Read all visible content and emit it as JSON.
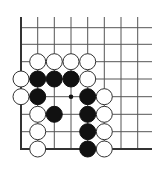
{
  "diagram": {
    "type": "go-board-fragment",
    "background": "#ffffff",
    "line_color": "#555555",
    "grid": {
      "columns": 8,
      "rows": 8,
      "col_x": [
        21,
        37.7,
        54.3,
        71,
        87.7,
        104.3,
        121,
        137.7
      ],
      "row_y": [
        27.7,
        44.3,
        61.7,
        79,
        96.7,
        114.3,
        131.7,
        149
      ],
      "top_open_y": 17,
      "right_open_x": 152,
      "left_edge": true,
      "bottom_edge": true
    },
    "stone_radius": 8,
    "stones": [
      {
        "color": "white",
        "col": 1,
        "row": 2
      },
      {
        "color": "white",
        "col": 2,
        "row": 2
      },
      {
        "color": "white",
        "col": 3,
        "row": 2
      },
      {
        "color": "white",
        "col": 4,
        "row": 2
      },
      {
        "color": "white",
        "col": 0,
        "row": 3
      },
      {
        "color": "black",
        "col": 1,
        "row": 3
      },
      {
        "color": "black",
        "col": 2,
        "row": 3
      },
      {
        "color": "black",
        "col": 3,
        "row": 3
      },
      {
        "color": "white",
        "col": 4,
        "row": 3
      },
      {
        "color": "white",
        "col": 0,
        "row": 4
      },
      {
        "color": "black",
        "col": 1,
        "row": 4
      },
      {
        "color": "black",
        "col": 4,
        "row": 4
      },
      {
        "color": "white",
        "col": 5,
        "row": 4
      },
      {
        "color": "white",
        "col": 1,
        "row": 5
      },
      {
        "color": "black",
        "col": 2,
        "row": 5
      },
      {
        "color": "black",
        "col": 4,
        "row": 5
      },
      {
        "color": "white",
        "col": 5,
        "row": 5
      },
      {
        "color": "white",
        "col": 1,
        "row": 6
      },
      {
        "color": "black",
        "col": 4,
        "row": 6
      },
      {
        "color": "white",
        "col": 5,
        "row": 6
      },
      {
        "color": "white",
        "col": 1,
        "row": 7
      },
      {
        "color": "black",
        "col": 4,
        "row": 7
      },
      {
        "color": "white",
        "col": 5,
        "row": 7
      }
    ],
    "markers": [
      {
        "type": "dot",
        "color": "black",
        "col": 3,
        "row": 4
      }
    ]
  }
}
